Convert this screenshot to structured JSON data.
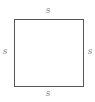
{
  "diagram": {
    "shape": "square",
    "stroke_color": "#555555",
    "label_color": "#8a8a8a",
    "labels": {
      "top": "s",
      "bottom": "s",
      "left": "s",
      "right": "s"
    }
  }
}
